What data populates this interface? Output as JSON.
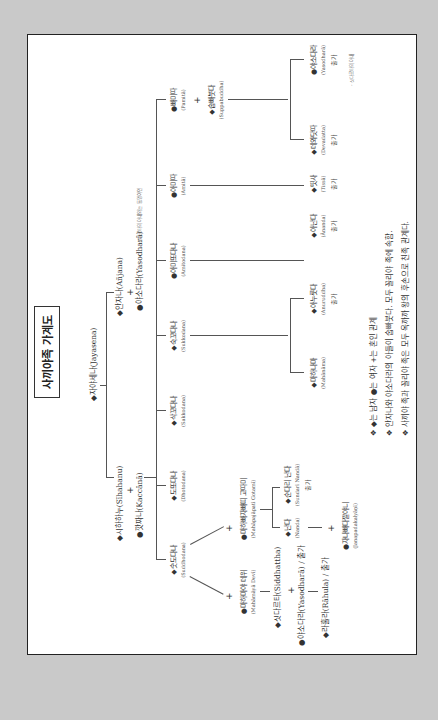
{
  "title": "사끼야족 가계도",
  "root": {
    "name": "◆자야세나(Jayasena)"
  },
  "gen1": {
    "sihahanu": "◆시하하누(Sīhahanu)",
    "kaccana": "●깟짜나(Kaccānā)",
    "anjana": "◆안자나(Añjana)",
    "yasodhara_elder": "●야소다라(Yasodharā)",
    "yasodhara_note": "- 싯다르타의 아내와는 동명이인"
  },
  "gen2": [
    {
      "k": "◆숫도다나",
      "e": "(Suddhodana)"
    },
    {
      "k": "◆도또다나",
      "e": "(Dhotodana)"
    },
    {
      "k": "◆삭꼬다나",
      "e": "(Sakkodana)"
    },
    {
      "k": "◆숙꼬다나",
      "e": "(Sukkodana)"
    },
    {
      "k": "●아미또다나",
      "e": "(Amitodana)"
    },
    {
      "k": "●아미따",
      "e": "(Amitā)"
    },
    {
      "k": "●빠미따",
      "e": "(Pamitā)"
    }
  ],
  "suppabuddha": {
    "k": "◆숩빠붓다",
    "e": "(Suppabuddha)"
  },
  "gen3": {
    "mahanama": {
      "k": "◆마하나마",
      "e": "(Mahānāma)"
    },
    "anuruddha": {
      "k": "◆아누룻다",
      "e": "(Anuruddha)",
      "c": "출가"
    },
    "ananda": {
      "k": "◆아난다",
      "e": "(Ānanda)",
      "c": "출가"
    },
    "tissa": {
      "k": "◆띳사",
      "e": "(Tissā)",
      "c": "출가"
    },
    "devadatta": {
      "k": "◆데와닷따",
      "e": "(Devadatta)",
      "c": "출가"
    },
    "yasodhara": {
      "k": "●야소다라",
      "e": "(Yasodharā)",
      "c": "출가",
      "note": "- 싯다르타의 아내"
    }
  },
  "suddhodana_line": {
    "mahamaya": {
      "k": "●마하마야 데위",
      "e": "(Mahāmāyā Devī)"
    },
    "pajapati": {
      "k": "●마하빠자빠띠 고따미",
      "e": "(Mahāpajāpatī Gotamī)"
    },
    "siddhattha": "◆싯다르타(Siddhattha)",
    "yasodhara_wife": "●야소다라(Yasodharā) / 출가",
    "rahula": "◆라훌라(Rāhula) / 출가",
    "nanda": {
      "k": "◆난다",
      "e": "(Nanda)"
    },
    "sundari": {
      "k": "◆순다리 난다",
      "e": "(Sundarī Nandā)",
      "c": "출가"
    },
    "janapada": {
      "k": "●자나빠다깔야니",
      "e": "(Janapadakalyāṇī)"
    }
  },
  "plus": "+",
  "legend": [
    "❖ ◆는 남자 ●는 여자 +는 혼인 관계",
    "❖ 안자나와 야소다라의 아들이 숩빠붓다. 모두 꼴리야 족에 속함.",
    "❖ 사끼야 족과 꼴리야 족은 모두 옥까까 왕의 후손으로 친족 관계다."
  ]
}
